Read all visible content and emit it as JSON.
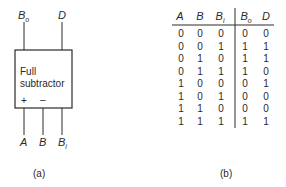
{
  "diagram_a": {
    "block_label_line1": "Full",
    "block_label_line2": "subtractor",
    "plus_sign": "+",
    "minus_sign": "–",
    "outputs": [
      {
        "main": "B",
        "sub": "o"
      },
      {
        "main": "D",
        "sub": ""
      }
    ],
    "inputs": [
      {
        "main": "A",
        "sub": ""
      },
      {
        "main": "B",
        "sub": ""
      },
      {
        "main": "B",
        "sub": "i"
      }
    ],
    "caption": "(a)"
  },
  "truth_table": {
    "headers": [
      {
        "main": "A",
        "sub": ""
      },
      {
        "main": "B",
        "sub": ""
      },
      {
        "main": "B",
        "sub": "i"
      },
      {
        "main": "B",
        "sub": "o"
      },
      {
        "main": "D",
        "sub": ""
      }
    ],
    "rows": [
      [
        "0",
        "0",
        "0",
        "0",
        "0"
      ],
      [
        "0",
        "0",
        "1",
        "1",
        "1"
      ],
      [
        "0",
        "1",
        "0",
        "1",
        "1"
      ],
      [
        "0",
        "1",
        "1",
        "1",
        "0"
      ],
      [
        "1",
        "0",
        "0",
        "0",
        "1"
      ],
      [
        "1",
        "0",
        "1",
        "0",
        "0"
      ],
      [
        "1",
        "1",
        "0",
        "0",
        "0"
      ],
      [
        "1",
        "1",
        "1",
        "1",
        "1"
      ]
    ],
    "caption": "(b)"
  }
}
